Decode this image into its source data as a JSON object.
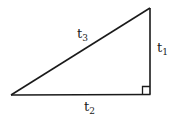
{
  "diagram": {
    "type": "right-triangle",
    "stroke_color": "#1a1a1a",
    "vertices": {
      "left": [
        11,
        95
      ],
      "right_angle": [
        150,
        94
      ],
      "top": [
        150,
        8
      ]
    },
    "right_angle_marker": true,
    "labels": {
      "hypotenuse": {
        "base": "t",
        "sub": "3"
      },
      "vertical_leg": {
        "base": "t",
        "sub": "1"
      },
      "horizontal_leg": {
        "base": "t",
        "sub": "2"
      }
    }
  }
}
